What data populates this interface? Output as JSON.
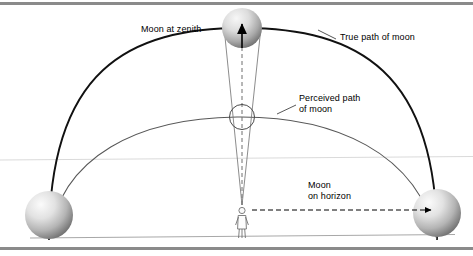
{
  "figure": {
    "title_clipped": "Moon illusion diagram",
    "labels": {
      "zenith": "Moon at zenith",
      "true_path": "True path of moon",
      "perceived_path": "Perceived path\nof moon",
      "horizon": "Moon\non horizon"
    },
    "elements": {
      "moon_zenith": "moon-sphere-zenith",
      "moon_left": "moon-sphere-left-horizon",
      "moon_right": "moon-sphere-right-horizon",
      "moon_perceived": "perceived-moon-circle",
      "observer": "observer-figure",
      "true_path_arc": "true-path-arc",
      "perceived_path_arc": "perceived-path-arc",
      "sight_cone": "sight-line-cone",
      "zenith_arrow": "zenith-direction-arrow",
      "horizon_arrow": "horizon-direction-arrow",
      "ground_line": "ground-line",
      "sky_line": "sky-horizon-line",
      "top_rule": "top-border-rule",
      "bottom_rule": "bottom-border-rule"
    },
    "colors": {
      "true_path": "#000000",
      "perceived_path": "#555555",
      "moon_light": "#f2f2f2",
      "moon_dark": "#808080",
      "rule": "#8a8a8a",
      "sky_line": "#d8d8d8",
      "ground_line": "#9a9a9a",
      "text": "#000000"
    }
  }
}
